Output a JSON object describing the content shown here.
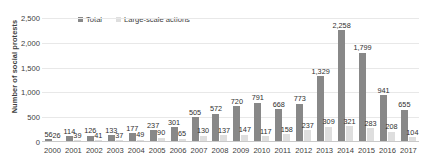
{
  "chart_data": {
    "type": "bar",
    "title": "",
    "xlabel": "",
    "ylabel": "Number of social protests",
    "ylim": [
      0,
      2500
    ],
    "yticks": [
      "0",
      "500",
      "1,000",
      "1,500",
      "2,000",
      "2,500"
    ],
    "ytick_values": [
      0,
      500,
      1000,
      1500,
      2000,
      2500
    ],
    "grid": true,
    "legend_position": "top-left",
    "categories": [
      "2000",
      "2001",
      "2002",
      "2003",
      "2004",
      "2005",
      "2006",
      "2007",
      "2008",
      "2009",
      "2010",
      "2011",
      "2012",
      "2013",
      "2014",
      "2015",
      "2016",
      "2017"
    ],
    "series": [
      {
        "name": "Total",
        "color": "#888888",
        "values": [
          56,
          114,
          126,
          133,
          177,
          237,
          301,
          505,
          572,
          720,
          791,
          668,
          773,
          1329,
          2258,
          1799,
          941,
          655
        ],
        "labels": [
          "56",
          "114",
          "126",
          "133",
          "177",
          "237",
          "301",
          "505",
          "572",
          "720",
          "791",
          "668",
          "773",
          "1,329",
          "2,258",
          "1,799",
          "941",
          "655"
        ]
      },
      {
        "name": "Large-scale actions",
        "color": "#dedede",
        "values": [
          26,
          39,
          41,
          37,
          49,
          90,
          65,
          130,
          137,
          147,
          117,
          158,
          237,
          309,
          321,
          283,
          208,
          104
        ],
        "labels": [
          "26",
          "39",
          "41",
          "37",
          "49",
          "90",
          "65",
          "130",
          "137",
          "147",
          "117",
          "158",
          "237",
          "309",
          "321",
          "283",
          "208",
          "104"
        ]
      }
    ]
  },
  "legend": {
    "items": [
      {
        "label": "Total",
        "swatch": "total"
      },
      {
        "label": "Large-scale actions",
        "swatch": "large"
      }
    ]
  }
}
